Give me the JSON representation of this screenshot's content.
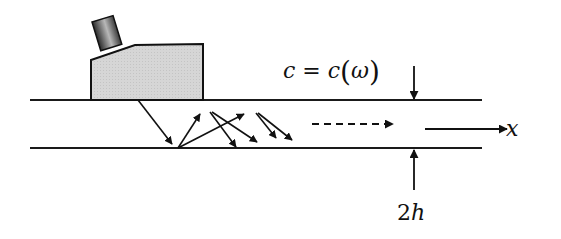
{
  "diagram": {
    "labels": {
      "velocity_formula_lhs": "c = c",
      "velocity_formula_open": "(",
      "velocity_formula_arg": "ω",
      "velocity_formula_close": ")",
      "propagation_axis": "x",
      "thickness_num": "2",
      "thickness_var": "h"
    },
    "colors": {
      "line": "#1a1a1a",
      "transducer_fill": "#d4d4d4",
      "transducer_head_dark": "#3a3a3a",
      "transducer_head_light": "#bdbdbd"
    },
    "plate": {
      "top_y": 100,
      "bottom_y": 148,
      "x_start": 30,
      "x_end": 482
    }
  }
}
